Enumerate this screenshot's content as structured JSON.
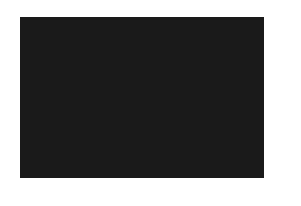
{
  "diagram": {
    "type": "knitting-chart",
    "columns": 13,
    "rows": 11,
    "column_labels": [
      "13",
      "12",
      "11",
      "10",
      "9",
      "8",
      "7",
      "6",
      "5",
      "4",
      "3",
      "2",
      "1"
    ],
    "row_labels_top_to_bottom": [
      "11",
      "10",
      "9",
      "8",
      "7",
      "6",
      "5",
      "4",
      "3",
      "2",
      "1"
    ],
    "colors": {
      "D": "#3c3c3c",
      "M": "#6e6e6e",
      "L": "#989898",
      "W": "#ffffff"
    },
    "grid_top_to_bottom": [
      "DDDDDDDDDDDDD",
      "MMMMMMMMMMMMM",
      "LLLLLLLLLLLLL",
      "WDWDDDWWDDDWD",
      "WDDDWWDDWWDDD",
      "DDWWDDWWDDWWD",
      "WDDDWWDDWWDDD",
      "WDWDDDWWDDDWD",
      "LLLLLLLLLLLLL",
      "MMMMMMMMMMMMM",
      "DDDDDDDDDDDDD"
    ]
  }
}
